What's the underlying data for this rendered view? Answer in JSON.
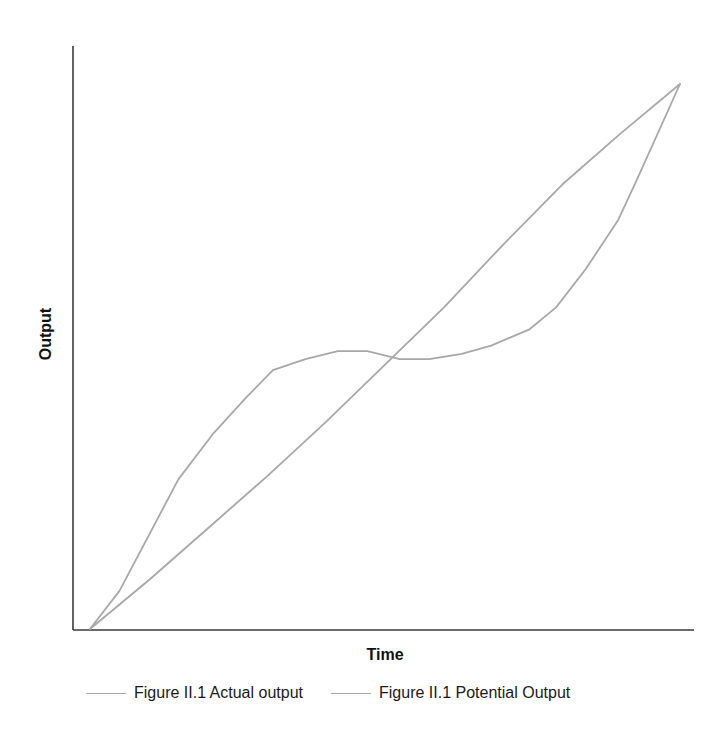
{
  "chart_data": {
    "type": "line",
    "title": "",
    "xlabel": "Time",
    "ylabel": "Output",
    "xlim": [
      0,
      100
    ],
    "ylim": [
      0,
      100
    ],
    "grid": false,
    "ticks": false,
    "legend_position": "bottom",
    "series": [
      {
        "name": "Figure II.1 Actual output",
        "color": "#a8a8a8",
        "x": [
          0,
          5,
          15,
          21,
          26.5,
          31,
          36.5,
          42,
          47,
          52.5,
          57.5,
          63,
          68,
          74.5,
          79,
          84,
          89.5,
          92.5,
          100
        ],
        "y": [
          0,
          7,
          27.5,
          36,
          42.5,
          47.5,
          49.5,
          51,
          51,
          49.5,
          49.5,
          50.5,
          52,
          55,
          59,
          66,
          75,
          82,
          100
        ]
      },
      {
        "name": "Figure II.1 Potential Output",
        "color": "#a8a8a8",
        "x": [
          0,
          10,
          20,
          30,
          40,
          50,
          60,
          70,
          80,
          90,
          100
        ],
        "y": [
          0,
          9,
          18.5,
          28,
          38,
          48.5,
          59,
          70.5,
          81.5,
          91,
          100
        ]
      }
    ]
  },
  "axes": {
    "x_title": "Time",
    "y_title": "Output"
  },
  "legend": {
    "items": [
      {
        "label": "Figure II.1 Actual output",
        "color": "#a8a8a8"
      },
      {
        "label": "Figure II.1 Potential Output",
        "color": "#a8a8a8"
      }
    ]
  }
}
